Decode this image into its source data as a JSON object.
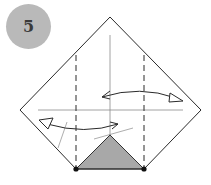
{
  "step": {
    "number": "5",
    "badge_color": "#b9b9b9",
    "text_color": "#3a3a3a"
  },
  "diagram": {
    "paper_shape": "diamond-square",
    "line_color": "#2a2a2a",
    "crease_color": "#8a8a8a",
    "fill_color": "#a8a8a8",
    "elements": [
      "paper-outline",
      "vertical-center-crease",
      "horizontal-center-crease",
      "left-valley-fold-dashed",
      "right-valley-fold-dashed",
      "shaded-bottom-triangle",
      "fold-point-left",
      "fold-point-right",
      "upper-fold-unfold-arrow",
      "lower-fold-unfold-arrow"
    ]
  }
}
